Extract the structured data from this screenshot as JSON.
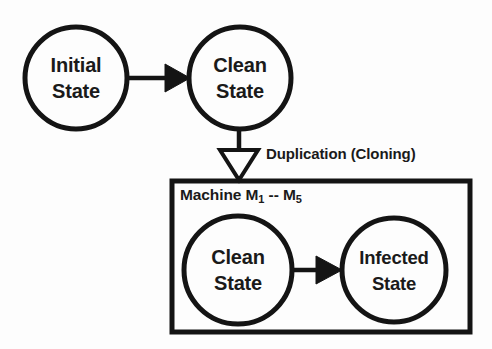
{
  "diagram": {
    "background_color": "#fdfdfd",
    "stroke_color": "#141414",
    "nodes": [
      {
        "id": "initial-state",
        "line1": "Initial",
        "line2": "State",
        "cx": 76,
        "cy": 78,
        "r": 51
      },
      {
        "id": "clean-state-top",
        "line1": "Clean",
        "line2": "State",
        "cx": 240,
        "cy": 78,
        "r": 51
      },
      {
        "id": "clean-state-inner",
        "line1": "Clean",
        "line2": "State",
        "cx": 238,
        "cy": 270,
        "r": 54
      },
      {
        "id": "infected-state",
        "line1": "Infected",
        "line2": "State",
        "cx": 394,
        "cy": 270,
        "r": 52
      }
    ],
    "edges": [
      {
        "id": "initial-to-clean",
        "arrowhead": "solid",
        "label": ""
      },
      {
        "id": "clean-to-machine",
        "arrowhead": "hollow",
        "label": "Duplication (Cloning)"
      },
      {
        "id": "clean-to-infected",
        "arrowhead": "solid",
        "label": ""
      }
    ],
    "group": {
      "id": "machine-group",
      "label_prefix": "Machine M",
      "label_sub_from": "1",
      "label_separator": " -- M",
      "label_sub_to": "5",
      "label_full": "Machine M1 -- M5",
      "x": 172,
      "y": 181,
      "width": 298,
      "height": 151
    }
  }
}
